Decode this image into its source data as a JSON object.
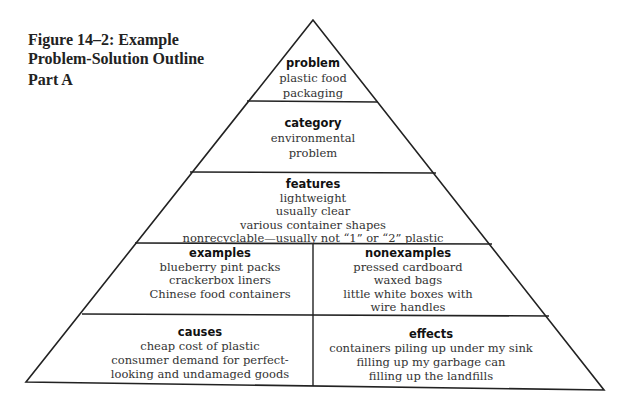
{
  "figure": {
    "caption_line1": "Figure 14–2: Example",
    "caption_line2": "Problem-Solution Outline",
    "part": "Part A"
  },
  "pyramid": {
    "problem": {
      "heading": "problem",
      "lines": [
        "plastic food",
        "packaging"
      ]
    },
    "category": {
      "heading": "category",
      "lines": [
        "environmental",
        "problem"
      ]
    },
    "features": {
      "heading": "features",
      "lines": [
        "lightweight",
        "usually clear",
        "various container shapes",
        "nonrecyclable—usually not “1” or “2” plastic"
      ]
    },
    "examples": {
      "heading": "examples",
      "lines": [
        "blueberry pint packs",
        "crackerbox liners",
        "Chinese food containers"
      ]
    },
    "nonexamples": {
      "heading": "nonexamples",
      "lines": [
        "pressed cardboard",
        "waxed bags",
        "little white boxes with",
        "wire handles"
      ]
    },
    "causes": {
      "heading": "causes",
      "lines": [
        "cheap cost of plastic",
        "consumer demand for perfect-",
        "looking and undamaged goods"
      ]
    },
    "effects": {
      "heading": "effects",
      "lines": [
        "containers piling up under my sink",
        "filling up my garbage can",
        "filling up the landfills"
      ]
    }
  }
}
